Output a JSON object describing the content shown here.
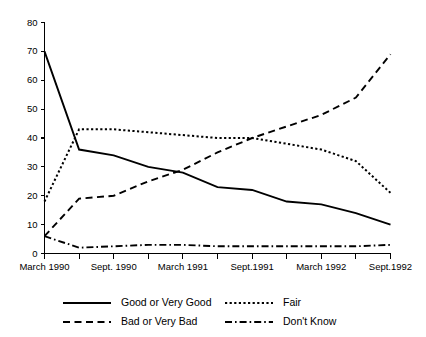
{
  "chart_data": {
    "type": "line",
    "title": "",
    "subtitle": "",
    "xlabel": "",
    "ylabel": "",
    "ylim": [
      0,
      80
    ],
    "ytick_values": [
      0,
      10,
      20,
      30,
      40,
      50,
      60,
      70,
      80
    ],
    "ytick_labels": [
      "0",
      "10",
      "20",
      "30",
      "40",
      "50",
      "60",
      "70",
      "80"
    ],
    "grid": false,
    "legend_position": "bottom",
    "x": [
      0,
      1,
      2,
      3,
      4,
      5,
      6,
      7,
      8,
      9,
      10
    ],
    "xtick_labels": [
      "March 1990",
      "",
      "Sept. 1990",
      "",
      "March 1991",
      "",
      "Sept.1991",
      "",
      "March 1992",
      "",
      "Sept.1992"
    ],
    "xtick_labels_visible": [
      "March 1990",
      "Sept. 1990",
      "March 1991",
      "Sept.1991",
      "March 1992",
      "Sept.1992"
    ],
    "series": [
      {
        "name": "Good or Very Good",
        "style": "solid",
        "color": "#000000",
        "values": [
          70,
          36,
          34,
          30,
          28,
          23,
          22,
          18,
          17,
          14,
          10
        ]
      },
      {
        "name": "Fair",
        "style": "dotted",
        "color": "#000000",
        "values": [
          18,
          43,
          43,
          42,
          41,
          40,
          40,
          38,
          36,
          32,
          21
        ]
      },
      {
        "name": "Bad or Very Bad",
        "style": "dashed",
        "color": "#000000",
        "values": [
          6,
          19,
          20,
          25,
          29,
          35,
          40,
          44,
          48,
          54,
          69
        ]
      },
      {
        "name": "Don't Know",
        "style": "dashdot",
        "color": "#000000",
        "values": [
          6,
          2,
          2.5,
          3,
          3,
          2.5,
          2.5,
          2.5,
          2.5,
          2.5,
          3
        ]
      }
    ]
  },
  "legend": {
    "entries": [
      {
        "label": "Good or Very Good",
        "style": "solid"
      },
      {
        "label": "Fair",
        "style": "dotted"
      },
      {
        "label": "Bad or Very Bad",
        "style": "dashed"
      },
      {
        "label": "Don't Know",
        "style": "dashdot"
      }
    ]
  }
}
